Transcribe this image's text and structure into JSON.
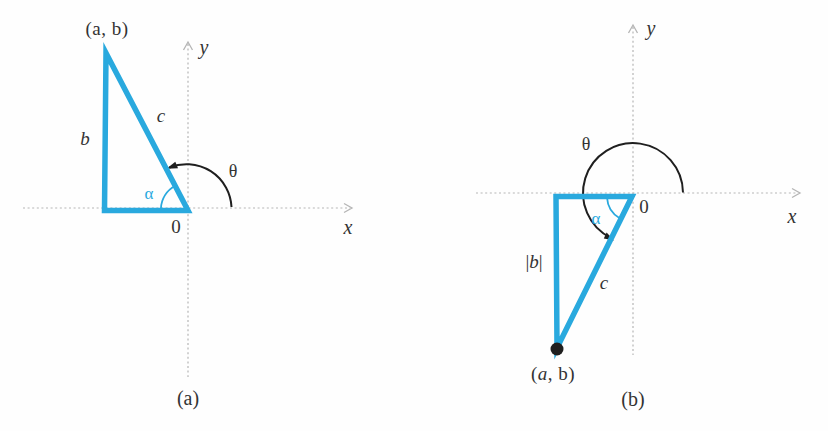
{
  "figure": {
    "accent_color": "#29a9de",
    "ink_color": "#1f1f1f",
    "text_color": "#333333",
    "axis_color": "#b5b5b5"
  },
  "panel_a": {
    "caption": "(a)",
    "point_label": "(a, b)",
    "x_axis_label": "x",
    "y_axis_label": "y",
    "origin_label": "0",
    "side_b_label": "b",
    "side_c_label": "c",
    "alpha_label": "α",
    "theta_label": "θ"
  },
  "panel_b": {
    "caption": "(b)",
    "point_label_parts": [
      "(",
      "a",
      ", ",
      "b",
      ")"
    ],
    "x_axis_label": "x",
    "y_axis_label": "y",
    "origin_label": "0",
    "side_b_abs_parts": [
      "|",
      "b",
      "|"
    ],
    "side_c_label": "c",
    "alpha_label": "α",
    "theta_label": "θ"
  }
}
